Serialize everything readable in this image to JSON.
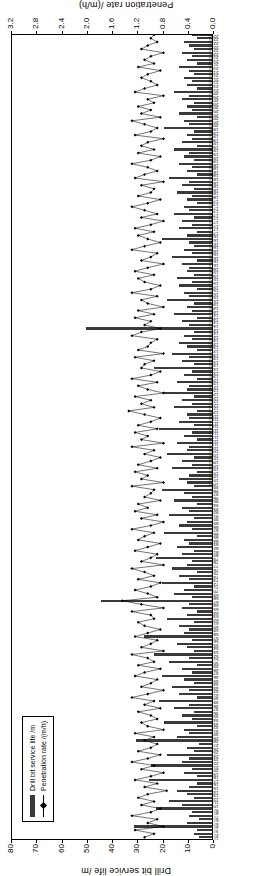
{
  "chart_data": {
    "type": "bar",
    "title": "",
    "xlabel": "",
    "ylabel": "Drill bit service life /m",
    "y2label": "Penetration rate /(m/h)",
    "ylim": [
      0,
      80
    ],
    "yticks": [
      0,
      10,
      20,
      30,
      40,
      50,
      60,
      70,
      80
    ],
    "y2lim": [
      0,
      3.2
    ],
    "y2ticks": [
      0.0,
      0.4,
      0.8,
      1.2,
      1.6,
      2.0,
      2.4,
      2.8,
      3.2
    ],
    "grid": false,
    "legend_position": "upper-left",
    "legend": [
      "Drill bit service life /m",
      "Penetration rate /(m/h)"
    ],
    "categories": [
      "1#",
      "2#",
      "3#",
      "4#",
      "5#",
      "6#",
      "7#",
      "8#",
      "9#",
      "10#",
      "11#",
      "12#",
      "13#",
      "14#",
      "15#",
      "16#",
      "17#",
      "18#",
      "19#",
      "20#",
      "21#",
      "22#",
      "23#",
      "24#",
      "25#",
      "26#",
      "27#",
      "28#",
      "29#",
      "30#",
      "31#",
      "32#",
      "33#",
      "34#",
      "35#",
      "36#",
      "37#",
      "38#",
      "39#",
      "40#",
      "41#",
      "42#",
      "43#",
      "44#",
      "45#",
      "46#",
      "47#",
      "48#",
      "49#",
      "50#",
      "51#",
      "52#",
      "53#",
      "54#",
      "55#",
      "56#",
      "57#",
      "58#",
      "59#",
      "60#",
      "61#",
      "62#",
      "63#",
      "64#",
      "65#",
      "66#",
      "67#",
      "68#",
      "69#",
      "70#",
      "71#",
      "72#",
      "73#",
      "74#",
      "75#",
      "76#",
      "77#",
      "78#",
      "79#",
      "80#",
      "81#",
      "82#",
      "83#",
      "84#",
      "85#",
      "86#",
      "87#",
      "88#",
      "89#",
      "90#",
      "91#",
      "92#",
      "93#",
      "94#",
      "95#",
      "96#",
      "97#",
      "98#",
      "99#",
      "100#",
      "101#",
      "102#",
      "103#",
      "104#",
      "105#",
      "106#",
      "107#",
      "108#",
      "109#",
      "110#",
      "111#",
      "112#",
      "113#",
      "114#",
      "115#",
      "116#",
      "117#",
      "118#",
      "119#",
      "120#",
      "121#",
      "122#",
      "123#",
      "124#",
      "125#",
      "126#",
      "127#",
      "128#",
      "129#",
      "130#",
      "131#",
      "132#",
      "133#",
      "134#",
      "135#",
      "136#",
      "137#",
      "138#",
      "139#",
      "140#",
      "141#",
      "142#",
      "143#",
      "144#",
      "145#",
      "146#",
      "147#",
      "148#",
      "149#",
      "150#",
      "151#",
      "152#",
      "153#",
      "154#",
      "155#",
      "156#",
      "157#",
      "158#",
      "159#",
      "160#",
      "161#",
      "162#",
      "163#",
      "164#",
      "165#",
      "166#",
      "167#",
      "168#",
      "169#",
      "170#",
      "171#",
      "172#",
      "173#",
      "174#",
      "175#",
      "176#",
      "177#",
      "178#",
      "179#",
      "180#",
      "181#",
      "182#",
      "183#",
      "184#",
      "185#",
      "186#",
      "187#",
      "188#",
      "189#",
      "190#",
      "191#",
      "192#",
      "193#",
      "194#",
      "195#",
      "196#",
      "197#",
      "198#",
      "199#",
      "200#",
      "201#",
      "202#",
      "203#",
      "204#",
      "205#",
      "206#",
      "207#",
      "208#",
      "209#",
      "210#",
      "211#",
      "212#",
      "213#",
      "214#",
      "215#",
      "216#",
      "217#",
      "218#",
      "219#",
      "220#",
      "221#",
      "222#",
      "223#",
      "224#",
      "225#"
    ],
    "series": [
      {
        "name": "Drill bit service life /m",
        "axis": "left",
        "unit": "m",
        "values": [
          5,
          7,
          6,
          31,
          10,
          5,
          9,
          8,
          22,
          12,
          17,
          7,
          10,
          14,
          9,
          6,
          25,
          6,
          11,
          8,
          24,
          12,
          9,
          18,
          7,
          10,
          5,
          30,
          14,
          9,
          11,
          6,
          19,
          8,
          12,
          7,
          15,
          9,
          21,
          6,
          13,
          9,
          16,
          7,
          11,
          20,
          8,
          12,
          6,
          17,
          9,
          23,
          7,
          10,
          14,
          8,
          27,
          11,
          9,
          13,
          7,
          18,
          10,
          6,
          12,
          9,
          44,
          8,
          15,
          11,
          7,
          20,
          9,
          13,
          6,
          16,
          10,
          8,
          22,
          12,
          7,
          14,
          9,
          11,
          6,
          19,
          8,
          13,
          10,
          7,
          17,
          9,
          12,
          6,
          15,
          8,
          11,
          20,
          7,
          10,
          13,
          9,
          6,
          16,
          8,
          12,
          7,
          18,
          10,
          9,
          14,
          6,
          11,
          8,
          21,
          7,
          13,
          9,
          10,
          6,
          15,
          8,
          12,
          7,
          19,
          10,
          9,
          14,
          6,
          11,
          8,
          23,
          7,
          12,
          9,
          16,
          6,
          10,
          13,
          8,
          11,
          7,
          50,
          9,
          12,
          6,
          15,
          8,
          10,
          7,
          18,
          9,
          11,
          6,
          13,
          8,
          14,
          7,
          10,
          9,
          12,
          6,
          16,
          8,
          11,
          7,
          9,
          20,
          10,
          6,
          13,
          8,
          12,
          7,
          15,
          9,
          11,
          6,
          10,
          8,
          14,
          7,
          12,
          9,
          17,
          6,
          10,
          8,
          13,
          7,
          11,
          9,
          15,
          6,
          12,
          8,
          10,
          7,
          19,
          9,
          11,
          6,
          13,
          8,
          10,
          7,
          12,
          9,
          15,
          6,
          10,
          8,
          11,
          7,
          9,
          13,
          6,
          10,
          8,
          12,
          7,
          9,
          11,
          6,
          8
        ]
      },
      {
        "name": "Penetration rate /(m/h)",
        "axis": "right",
        "unit": "m/h",
        "values": [
          1.1,
          0.95,
          1.25,
          0.8,
          1.05,
          0.9,
          1.3,
          1.0,
          0.85,
          1.15,
          0.95,
          1.2,
          1.05,
          0.75,
          1.1,
          0.9,
          1.25,
          1.0,
          0.8,
          1.15,
          0.95,
          1.3,
          1.05,
          0.85,
          1.2,
          1.0,
          0.9,
          1.1,
          0.95,
          1.25,
          0.8,
          1.05,
          1.15,
          0.9,
          1.0,
          1.2,
          0.85,
          1.1,
          0.95,
          1.3,
          1.05,
          0.8,
          1.15,
          1.0,
          0.9,
          1.25,
          1.1,
          0.85,
          1.2,
          0.95,
          1.05,
          1.3,
          0.8,
          1.15,
          1.0,
          0.9,
          1.25,
          1.05,
          0.85,
          1.1,
          1.2,
          0.95,
          1.0,
          1.3,
          0.8,
          1.15,
          1.45,
          0.9,
          1.05,
          1.25,
          1.0,
          0.85,
          1.2,
          0.95,
          1.1,
          1.3,
          0.8,
          1.15,
          1.0,
          0.9,
          1.25,
          1.05,
          0.85,
          1.2,
          1.1,
          0.95,
          1.3,
          1.0,
          0.8,
          1.15,
          0.9,
          1.25,
          1.05,
          1.2,
          0.85,
          1.1,
          1.0,
          0.95,
          1.3,
          0.8,
          1.15,
          1.05,
          1.25,
          0.9,
          1.2,
          1.0,
          0.85,
          1.1,
          0.95,
          1.3,
          0.8,
          1.15,
          1.05,
          1.25,
          0.9,
          1.2,
          1.0,
          0.85,
          1.1,
          1.35,
          0.95,
          1.15,
          1.0,
          1.25,
          0.8,
          1.05,
          1.2,
          0.9,
          1.3,
          1.0,
          0.85,
          1.15,
          1.1,
          0.95,
          1.25,
          0.8,
          1.2,
          1.05,
          1.0,
          0.9,
          1.3,
          1.15,
          0.85,
          1.1,
          1.0,
          1.25,
          0.95,
          1.2,
          0.8,
          1.05,
          1.15,
          0.9,
          1.3,
          1.0,
          0.85,
          1.1,
          1.2,
          0.95,
          1.25,
          1.05,
          0.8,
          1.15,
          1.0,
          0.9,
          1.3,
          1.1,
          0.85,
          1.05,
          1.2,
          0.95,
          1.25,
          1.0,
          0.8,
          1.15,
          0.9,
          1.1,
          1.3,
          1.05,
          0.85,
          1.2,
          1.0,
          0.95,
          1.15,
          0.8,
          1.25,
          1.1,
          0.9,
          1.05,
          1.3,
          1.0,
          0.85,
          1.2,
          0.95,
          1.15,
          1.05,
          0.8,
          1.25,
          1.0,
          0.9,
          1.1,
          1.3,
          0.85,
          1.15,
          1.0,
          1.2,
          0.95,
          1.05,
          0.8,
          1.25,
          1.1,
          0.9,
          1.0,
          1.15,
          1.05,
          0.85,
          1.2,
          0.95,
          1.1,
          1.0,
          0.8,
          1.15,
          1.05,
          0.9,
          1.0,
          0.95
        ]
      }
    ]
  }
}
